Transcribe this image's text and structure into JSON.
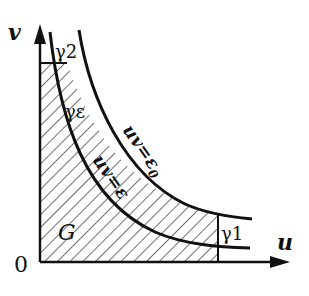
{
  "diagram": {
    "axes": {
      "x_label": "u",
      "y_label": "v",
      "origin_label": "0"
    },
    "curves": [
      {
        "name": "inner",
        "label": "uv=ε"
      },
      {
        "name": "outer",
        "label": "uv=ε0"
      }
    ],
    "labels": {
      "gamma2": "γ2",
      "gamma_eps": "γε",
      "gamma1": "γ1",
      "region": "G",
      "inner_curve": "uv=ε",
      "outer_curve": "uv=ε",
      "outer_sub": "0"
    },
    "colors": {
      "stroke": "#111111",
      "background": "#ffffff"
    }
  }
}
